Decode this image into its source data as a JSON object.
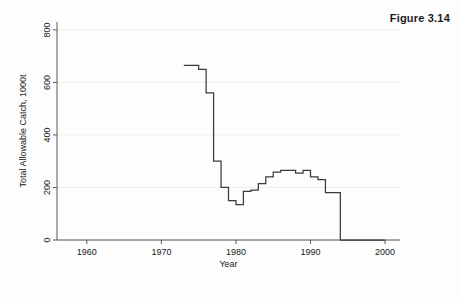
{
  "figure": {
    "caption": "Figure 3.14"
  },
  "chart_data": {
    "type": "line",
    "line_style": "step-post",
    "title": "",
    "subtitle": "",
    "xlabel": "Year",
    "ylabel": "Total Allowable Catch, 1000t",
    "xlim": [
      1956,
      2002
    ],
    "ylim": [
      0,
      830
    ],
    "xticks": [
      1960,
      1970,
      1980,
      1990,
      2000
    ],
    "xtick_labels": [
      "1960",
      "1970",
      "1980",
      "1990",
      "2000"
    ],
    "yticks": [
      0,
      200,
      400,
      600,
      800
    ],
    "ytick_labels": [
      "0",
      "200",
      "400",
      "600",
      "800"
    ],
    "grid": "horizontal-faint",
    "legend": "none",
    "series": [
      {
        "name": "Total Allowable Catch",
        "color": "#3b3b3b",
        "x": [
          1973,
          1974,
          1975,
          1976,
          1977,
          1978,
          1979,
          1980,
          1981,
          1982,
          1983,
          1984,
          1985,
          1986,
          1987,
          1988,
          1989,
          1990,
          1991,
          1992,
          1993,
          1994,
          1995,
          1996,
          1997,
          1998,
          1999,
          2000
        ],
        "values": [
          665,
          665,
          650,
          560,
          300,
          200,
          150,
          135,
          185,
          190,
          215,
          240,
          258,
          265,
          265,
          255,
          265,
          240,
          230,
          180,
          180,
          0,
          0,
          0,
          0,
          0,
          0,
          0
        ]
      }
    ]
  },
  "axes": {
    "y_axis_label": "Total Allowable Catch, 1000t",
    "x_axis_label": "Year"
  }
}
